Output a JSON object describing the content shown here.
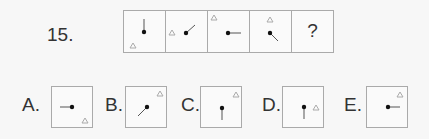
{
  "question": {
    "number": "15.",
    "sequence": [
      {
        "id": "cell-1",
        "line_direction": "up",
        "triangle_position": "bottom-left"
      },
      {
        "id": "cell-2",
        "line_direction": "up-right",
        "triangle_position": "middle-left"
      },
      {
        "id": "cell-3",
        "line_direction": "right",
        "triangle_position": "top-left"
      },
      {
        "id": "cell-4",
        "line_direction": "down-right",
        "triangle_position": "top-middle"
      },
      {
        "id": "cell-5",
        "placeholder": "?"
      }
    ]
  },
  "options": [
    {
      "label": "A.",
      "line_direction": "left",
      "triangle_position": "bottom-right"
    },
    {
      "label": "B.",
      "line_direction": "down-left",
      "triangle_position": "top-right"
    },
    {
      "label": "C.",
      "line_direction": "down",
      "triangle_position": "top-right"
    },
    {
      "label": "D.",
      "line_direction": "down",
      "triangle_position": "middle-right"
    },
    {
      "label": "E.",
      "line_direction": "right",
      "triangle_position": "top-right"
    }
  ],
  "colors": {
    "line": "#555555",
    "dot": "#111111",
    "triangle": "#aaaaaa",
    "border": "#aaaaaa"
  }
}
